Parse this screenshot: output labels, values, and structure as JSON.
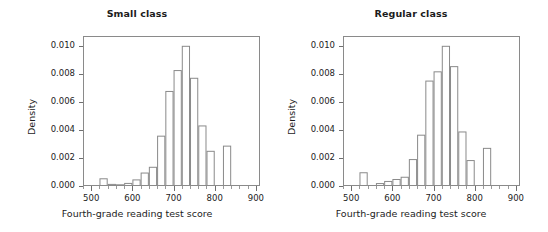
{
  "figure": {
    "width": 548,
    "height": 232,
    "background": "#ffffff",
    "bar_stroke_color": "#8a8a8a",
    "bar_fill_color": "#ffffff",
    "axis_color": "#8a8a8a",
    "text_color": "#1c1c1c"
  },
  "panels": [
    {
      "id": "small-class",
      "title": "Small class",
      "xlabel": "Fourth-grade reading test score",
      "ylabel": "Density"
    },
    {
      "id": "regular-class",
      "title": "Regular class",
      "xlabel": "Fourth-grade reading test score",
      "ylabel": "Density"
    }
  ],
  "axes": {
    "x_ticks": [
      500,
      600,
      700,
      800,
      900
    ],
    "x_tick_labels": [
      "500",
      "600",
      "700",
      "800",
      "900"
    ],
    "x_minor_step": 20,
    "x_range": [
      480,
      910
    ],
    "y_ticks": [
      0.0,
      0.002,
      0.004,
      0.006,
      0.008,
      0.01
    ],
    "y_tick_labels": [
      "0.000",
      "0.002",
      "0.004",
      "0.006",
      "0.008",
      "0.010"
    ],
    "y_range": [
      0.0,
      0.0107
    ],
    "grid": false,
    "legend": "none"
  },
  "chart_data": [
    {
      "type": "bar",
      "id": "small-class",
      "title": "Small class",
      "xlabel": "Fourth-grade reading test score",
      "ylabel": "Density",
      "xlim": [
        480,
        910
      ],
      "ylim": [
        0,
        0.0107
      ],
      "grid": false,
      "legend": "none",
      "bin_width": 20,
      "bin_starts": [
        520,
        540,
        560,
        580,
        600,
        620,
        640,
        660,
        680,
        700,
        720,
        740,
        760,
        780,
        800,
        820
      ],
      "categories": [
        "520-540",
        "540-560",
        "560-580",
        "580-600",
        "600-620",
        "620-640",
        "640-660",
        "660-680",
        "680-700",
        "700-720",
        "720-740",
        "740-760",
        "760-780",
        "780-800",
        "800-820",
        "820-840"
      ],
      "values": [
        0.00055,
        0.00015,
        0.00012,
        0.00022,
        0.00047,
        0.00096,
        0.00137,
        0.00359,
        0.00678,
        0.00827,
        0.01,
        0.00772,
        0.00432,
        0.00251,
        0.0,
        0.00288
      ]
    },
    {
      "type": "bar",
      "id": "regular-class",
      "title": "Regular class",
      "xlabel": "Fourth-grade reading test score",
      "ylabel": "Density",
      "xlim": [
        480,
        910
      ],
      "ylim": [
        0,
        0.0107
      ],
      "grid": false,
      "legend": "none",
      "bin_width": 20,
      "bin_starts": [
        520,
        540,
        560,
        580,
        600,
        620,
        640,
        660,
        680,
        700,
        720,
        740,
        760,
        780,
        800,
        820
      ],
      "categories": [
        "520-540",
        "540-560",
        "560-580",
        "580-600",
        "600-620",
        "620-640",
        "640-660",
        "660-680",
        "680-700",
        "700-720",
        "720-740",
        "740-760",
        "760-780",
        "780-800",
        "800-820",
        "820-840"
      ],
      "values": [
        0.00098,
        0.0,
        0.00021,
        0.00036,
        0.0005,
        0.00066,
        0.00192,
        0.00366,
        0.00752,
        0.00818,
        0.01,
        0.00855,
        0.00389,
        0.00185,
        0.0,
        0.00272
      ]
    }
  ]
}
